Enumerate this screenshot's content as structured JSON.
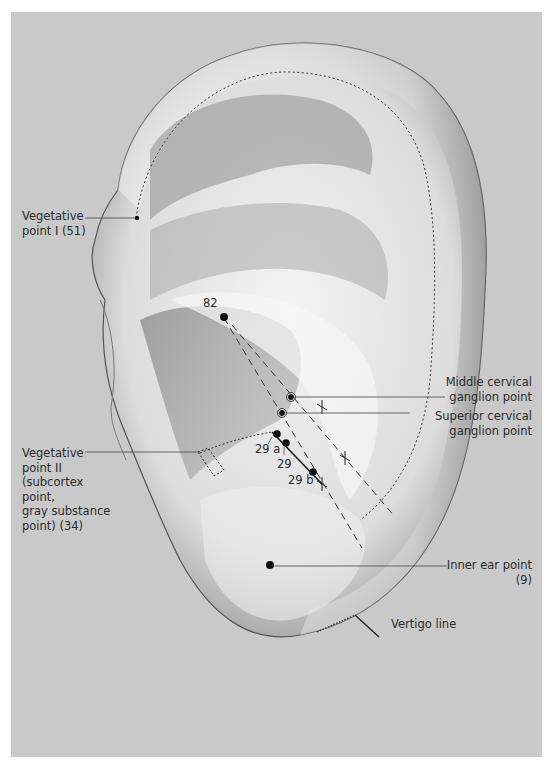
{
  "figure": {
    "background_color": "#c9c9c9",
    "frame_color": "#ffffff"
  },
  "labels": {
    "vegetative_point_1": [
      "Vegetative",
      "point I (51)"
    ],
    "vegetative_point_2": [
      "Vegetative",
      "point II",
      "(subcortex",
      "point,",
      "gray substance",
      "point) (34)"
    ],
    "middle_cervical": [
      "Middle cervical",
      "ganglion point"
    ],
    "superior_cervical": [
      "Superior cervical",
      "ganglion point"
    ],
    "inner_ear": [
      "Inner ear point",
      "(9)"
    ],
    "vertigo_line": "Vertigo line"
  },
  "point_numbers": {
    "p82": "82",
    "p29a": "29 a",
    "p29": "29",
    "p29b": "29 b"
  },
  "legend": {
    "vertigo_line_label": "Vertigo line",
    "symbol": "dotted-then-solid angled line"
  }
}
